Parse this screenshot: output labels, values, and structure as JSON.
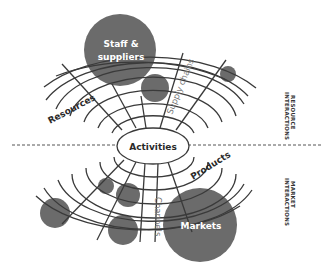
{
  "diagram": {
    "center_label": "Activities",
    "upper": {
      "side_label_line1": "RESOURCE",
      "side_label_line2": "INTERACTIONS",
      "axis_labels": {
        "left": "Resources",
        "right": "Supply chains"
      },
      "bubble_label": "Staff &\nsuppliers",
      "bubble_label_line1": "Staff &",
      "bubble_label_line2": "suppliers"
    },
    "lower": {
      "side_label_line1": "MARKET",
      "side_label_line2": "INTERACTIONS",
      "axis_labels": {
        "right": "Products",
        "center": "Channels"
      },
      "bubble_label": "Markets"
    },
    "colors": {
      "bubble": "#6b6b6b",
      "line": "#3a3a3a",
      "background": "#ffffff"
    }
  }
}
